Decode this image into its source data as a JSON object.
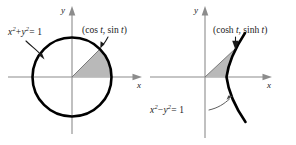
{
  "figure": {
    "background_color": "#ffffff",
    "curve_color": "#000000",
    "axis_color": "#8c8c8c",
    "shade_color": "#b9b9b9"
  },
  "left_panel": {
    "name": "unit-circle-panel",
    "curve_name": "unit-circle",
    "equation_label": {
      "text": "x2 + y2 = 1",
      "var1": "x",
      "exp1": "2",
      "operator": "+",
      "var2": "y",
      "exp2": "2",
      "equals": "= 1"
    },
    "point_label": "(cos t, sin t)",
    "point_prefix": "(cos ",
    "point_param": "t",
    "point_middle": ", sin ",
    "point_suffix": ")",
    "x_axis_label": "x",
    "y_axis_label": "y",
    "shaded_region": "circular-sector",
    "sector_angle_degrees": 45
  },
  "right_panel": {
    "name": "unit-hyperbola-panel",
    "curve_name": "unit-hyperbola-right-branch",
    "equation_label": {
      "text": "x2 - y2 = 1",
      "var1": "x",
      "exp1": "2",
      "operator": "−",
      "var2": "y",
      "exp2": "2",
      "equals": "= 1"
    },
    "point_label": "(cosh t, sinh t)",
    "point_prefix": "(cosh ",
    "point_param": "t",
    "point_middle": ", sinh ",
    "point_suffix": ")",
    "x_axis_label": "x",
    "y_axis_label": "y",
    "shaded_region": "hyperbolic-sector"
  }
}
